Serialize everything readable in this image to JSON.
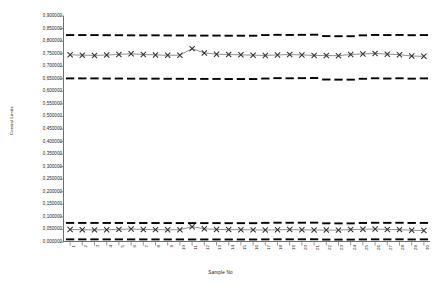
{
  "chart_data": {
    "type": "line",
    "title": "",
    "xlabel": "Sample No",
    "ylabel": "Central Limits",
    "grid": false,
    "legend": "none",
    "ylim": [
      0.0,
      0.9
    ],
    "ytick_step": 0.05,
    "ytick_labels": [
      "0,900000",
      "0,850000",
      "0,800000",
      "0,750000",
      "0,700000",
      "0,650000",
      "0,600000",
      "0,550000",
      "0,500000",
      "0,450000",
      "0,400000",
      "0,350000",
      "0,300000",
      "0,250000",
      "0,200000",
      "0,150000",
      "0,100000",
      "0,050000",
      "0,000000"
    ],
    "ytick_values": [
      0.9,
      0.85,
      0.8,
      0.75,
      0.7,
      0.65,
      0.6,
      0.55,
      0.5,
      0.45,
      0.4,
      0.35,
      0.3,
      0.25,
      0.2,
      0.15,
      0.1,
      0.05,
      0.0
    ],
    "categories": [
      "1",
      "2",
      "3",
      "4",
      "5",
      "6",
      "7",
      "8",
      "9",
      "10",
      "11",
      "12",
      "13",
      "14",
      "15",
      "16",
      "17",
      "18",
      "19",
      "20",
      "21",
      "22",
      "23",
      "24",
      "25",
      "26",
      "27",
      "28",
      "29",
      "30"
    ],
    "series": [
      {
        "name": "Upper UCL",
        "style": "dashed",
        "marker": "none",
        "color": "#000000",
        "values": [
          0.824,
          0.824,
          0.824,
          0.8235,
          0.8235,
          0.823,
          0.823,
          0.823,
          0.8225,
          0.8225,
          0.822,
          0.822,
          0.822,
          0.8215,
          0.8215,
          0.8215,
          0.824,
          0.825,
          0.8245,
          0.825,
          0.8255,
          0.82,
          0.8195,
          0.8195,
          0.823,
          0.8245,
          0.824,
          0.8245,
          0.8235,
          0.824
        ]
      },
      {
        "name": "Upper Mean",
        "style": "solid",
        "marker": "x",
        "color": "#333333",
        "values": [
          0.7455,
          0.744,
          0.743,
          0.7445,
          0.747,
          0.75,
          0.7465,
          0.745,
          0.7435,
          0.744,
          0.77,
          0.753,
          0.748,
          0.7465,
          0.7455,
          0.744,
          0.743,
          0.745,
          0.7465,
          0.745,
          0.743,
          0.7425,
          0.742,
          0.747,
          0.749,
          0.751,
          0.748,
          0.746,
          0.7405,
          0.7395
        ]
      },
      {
        "name": "Upper LCL",
        "style": "dashed",
        "marker": "none",
        "color": "#000000",
        "values": [
          0.6515,
          0.6515,
          0.6515,
          0.651,
          0.651,
          0.6505,
          0.6505,
          0.6505,
          0.65,
          0.65,
          0.6495,
          0.6495,
          0.6495,
          0.649,
          0.649,
          0.649,
          0.651,
          0.6525,
          0.652,
          0.6525,
          0.653,
          0.647,
          0.6465,
          0.6465,
          0.65,
          0.652,
          0.651,
          0.652,
          0.6505,
          0.6515
        ]
      },
      {
        "name": "Lower UCL",
        "style": "dashed",
        "marker": "none",
        "color": "#000000",
        "values": [
          0.076,
          0.076,
          0.076,
          0.0758,
          0.0758,
          0.0756,
          0.0756,
          0.0756,
          0.0754,
          0.0754,
          0.0752,
          0.0752,
          0.0752,
          0.075,
          0.075,
          0.075,
          0.0762,
          0.0768,
          0.0766,
          0.0768,
          0.077,
          0.0745,
          0.0742,
          0.0742,
          0.0758,
          0.0766,
          0.0762,
          0.0766,
          0.0758,
          0.076
        ]
      },
      {
        "name": "Lower Mean",
        "style": "solid",
        "marker": "x",
        "color": "#333333",
        "values": [
          0.0495,
          0.0488,
          0.0483,
          0.049,
          0.0502,
          0.0516,
          0.0499,
          0.0492,
          0.0485,
          0.0488,
          0.061,
          0.0525,
          0.0501,
          0.0494,
          0.049,
          0.0483,
          0.0478,
          0.0487,
          0.0494,
          0.0487,
          0.0478,
          0.0475,
          0.0473,
          0.0496,
          0.0506,
          0.0515,
          0.0501,
          0.0492,
          0.0465,
          0.046
        ]
      },
      {
        "name": "Lower LCL",
        "style": "dashed",
        "marker": "none",
        "color": "#000000",
        "values": [
          0.0105,
          0.0105,
          0.0105,
          0.0104,
          0.0104,
          0.0103,
          0.0103,
          0.0103,
          0.0102,
          0.0102,
          0.0101,
          0.0101,
          0.0101,
          0.01,
          0.01,
          0.01,
          0.0104,
          0.0107,
          0.0106,
          0.0107,
          0.0108,
          0.0097,
          0.0096,
          0.0096,
          0.0102,
          0.0106,
          0.0104,
          0.0106,
          0.0102,
          0.0105
        ]
      }
    ]
  }
}
